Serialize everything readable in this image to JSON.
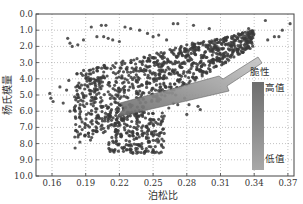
{
  "chart_data": {
    "type": "scatter",
    "title": "",
    "xlabel": "泊松比",
    "ylabel": "杨氏模量",
    "xlim": [
      0.145,
      0.375
    ],
    "ylim": [
      10.0,
      0.0
    ],
    "y_inverted": true,
    "grid": true,
    "grid_style": "dotted",
    "x_ticks": [
      "0.16",
      "0.19",
      "0.22",
      "0.25",
      "0.28",
      "0.31",
      "0.34",
      "0.37"
    ],
    "y_ticks": [
      "0.0",
      "1.0",
      "2.0",
      "3.0",
      "4.0",
      "5.0",
      "6.0",
      "7.0",
      "8.0",
      "9.0",
      "10.0"
    ],
    "series": [
      {
        "name": "样本点",
        "color": "#3a3a3a",
        "description": "Dense point cloud: band from (0.18,6.0) rising to (0.34,1.5); spread cluster down to (0.23,8.6); sparse points near y=0.6–2.0 across 0.17–0.37",
        "points": [
          [
            0.158,
            4.9
          ],
          [
            0.159,
            5.2
          ],
          [
            0.161,
            5.4
          ],
          [
            0.167,
            4.5
          ],
          [
            0.17,
            5.5
          ],
          [
            0.173,
            4.7
          ],
          [
            0.175,
            4.1
          ],
          [
            0.174,
            1.5
          ],
          [
            0.176,
            1.8
          ],
          [
            0.178,
            2.0
          ],
          [
            0.183,
            1.9
          ],
          [
            0.188,
            1.6
          ],
          [
            0.195,
            0.8
          ],
          [
            0.2,
            1.4
          ],
          [
            0.204,
            0.7
          ],
          [
            0.208,
            0.7
          ],
          [
            0.206,
            1.4
          ],
          [
            0.21,
            1.5
          ],
          [
            0.214,
            1.6
          ],
          [
            0.22,
            1.7
          ],
          [
            0.225,
            0.8
          ],
          [
            0.23,
            0.9
          ],
          [
            0.238,
            1.0
          ],
          [
            0.245,
            1.2
          ],
          [
            0.25,
            1.4
          ],
          [
            0.255,
            1.3
          ],
          [
            0.262,
            1.6
          ],
          [
            0.268,
            0.6
          ],
          [
            0.272,
            0.6
          ],
          [
            0.286,
            0.7
          ],
          [
            0.3,
            0.9
          ],
          [
            0.32,
            1.4
          ],
          [
            0.335,
            0.9
          ],
          [
            0.35,
            0.4
          ],
          [
            0.352,
            1.6
          ],
          [
            0.358,
            1.4
          ],
          [
            0.362,
            1.4
          ],
          [
            0.365,
            1.0
          ],
          [
            0.372,
            0.6
          ],
          [
            0.176,
            6.0
          ],
          [
            0.18,
            5.9
          ],
          [
            0.185,
            5.6
          ],
          [
            0.188,
            5.0
          ],
          [
            0.192,
            4.5
          ],
          [
            0.195,
            4.0
          ],
          [
            0.19,
            3.8
          ],
          [
            0.2,
            3.5
          ],
          [
            0.205,
            4.2
          ],
          [
            0.21,
            4.8
          ],
          [
            0.215,
            5.2
          ],
          [
            0.22,
            5.6
          ],
          [
            0.225,
            4.0
          ],
          [
            0.23,
            3.6
          ],
          [
            0.235,
            3.3
          ],
          [
            0.24,
            3.0
          ],
          [
            0.245,
            2.9
          ],
          [
            0.25,
            2.7
          ],
          [
            0.255,
            2.5
          ],
          [
            0.26,
            2.4
          ],
          [
            0.265,
            2.2
          ],
          [
            0.27,
            2.1
          ],
          [
            0.275,
            2.0
          ],
          [
            0.28,
            1.9
          ],
          [
            0.285,
            1.8
          ],
          [
            0.29,
            1.8
          ],
          [
            0.295,
            1.7
          ],
          [
            0.3,
            1.7
          ],
          [
            0.305,
            1.6
          ],
          [
            0.31,
            1.6
          ],
          [
            0.315,
            1.6
          ],
          [
            0.32,
            1.5
          ],
          [
            0.325,
            1.5
          ],
          [
            0.33,
            1.5
          ],
          [
            0.335,
            1.5
          ],
          [
            0.2,
            6.3
          ],
          [
            0.205,
            6.6
          ],
          [
            0.21,
            6.5
          ],
          [
            0.215,
            6.9
          ],
          [
            0.218,
            7.2
          ],
          [
            0.222,
            7.5
          ],
          [
            0.226,
            7.8
          ],
          [
            0.228,
            8.1
          ],
          [
            0.23,
            8.4
          ],
          [
            0.232,
            8.6
          ],
          [
            0.236,
            8.3
          ],
          [
            0.24,
            8.0
          ],
          [
            0.244,
            7.6
          ],
          [
            0.246,
            7.2
          ],
          [
            0.25,
            6.8
          ],
          [
            0.255,
            6.5
          ],
          [
            0.26,
            6.3
          ],
          [
            0.264,
            5.8
          ],
          [
            0.268,
            5.5
          ],
          [
            0.272,
            5.6
          ],
          [
            0.278,
            5.2
          ],
          [
            0.28,
            6.2
          ],
          [
            0.282,
            5.6
          ],
          [
            0.29,
            5.7
          ],
          [
            0.292,
            5.9
          ],
          [
            0.26,
            4.8
          ],
          [
            0.25,
            4.6
          ],
          [
            0.244,
            8.3
          ],
          [
            0.248,
            8.2
          ],
          [
            0.236,
            7.4
          ],
          [
            0.233,
            7.0
          ],
          [
            0.27,
            5.0
          ],
          [
            0.275,
            3.3
          ]
        ]
      }
    ],
    "annotations": [
      {
        "type": "arrow",
        "from": [
          0.31,
          2.8
        ],
        "to": [
          0.22,
          6.2
        ],
        "fill": "gradient",
        "note": "direction of increasing brittleness"
      },
      {
        "type": "colorbar",
        "title": "脆性",
        "top_label": "高值",
        "bottom_label": "低值",
        "x": 0.342,
        "y_range": [
          4.2,
          9.3
        ]
      }
    ]
  }
}
